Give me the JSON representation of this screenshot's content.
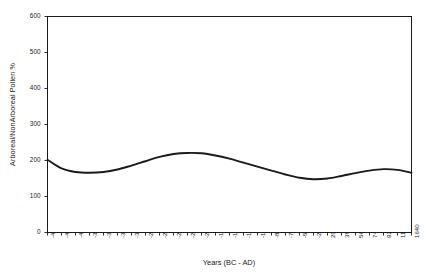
{
  "chart_data": {
    "type": "line",
    "title": "",
    "xlabel": "Years (BC - AD)",
    "ylabel": "Arboreal/NonArboreal Pollen %",
    "ylim": [
      0,
      600
    ],
    "yticks": [
      0,
      100,
      200,
      300,
      400,
      500,
      600
    ],
    "grid": false,
    "legend": null,
    "categories": [
      "-4480",
      "-4300",
      "-4030",
      "-3850",
      "-3680",
      "-3400",
      "-3130",
      "-2960",
      "-2680",
      "-2500",
      "-2230",
      "-2050",
      "-1780",
      "-1600",
      "-1330",
      "-1150",
      "-880",
      "-700",
      "-520",
      "-250",
      "200",
      "380",
      "560",
      "740",
      "920",
      "1100",
      "1640"
    ],
    "series": [
      {
        "name": "Arboreal/NonArboreal Pollen %",
        "color": "#1a1a1a",
        "values": [
          202,
          178,
          168,
          166,
          168,
          175,
          186,
          198,
          210,
          218,
          221,
          220,
          214,
          205,
          194,
          183,
          172,
          161,
          152,
          148,
          150,
          157,
          165,
          172,
          176,
          174,
          166
        ]
      }
    ]
  },
  "axes": {
    "frame_color": "#1a1a1a",
    "background": "#ffffff"
  }
}
